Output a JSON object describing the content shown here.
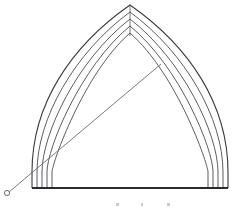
{
  "figure": {
    "type": "technical-line-drawing",
    "background_color": "#ffffff",
    "line_color": "#4a4a50",
    "baseline_color": "#2b2b2f",
    "canvas": {
      "width": 244,
      "height": 210
    }
  },
  "geometry": {
    "apex": {
      "x": 130,
      "y": 5
    },
    "springing_left": {
      "x": 32,
      "y": 188
    },
    "springing_right": {
      "x": 228,
      "y": 188
    },
    "baseline": {
      "x1": 32,
      "y1": 188,
      "x2": 228,
      "y2": 188
    },
    "centerline": {
      "x1": 130,
      "y1": 5,
      "x2": 130,
      "y2": 36
    },
    "moulding_count": 5,
    "moulding_offsets_px": [
      0,
      5,
      10,
      15,
      20
    ]
  },
  "construction": {
    "center_marker": {
      "x": 7,
      "y": 193,
      "radius": 2.6,
      "label": "compass centre point"
    },
    "radius_line": {
      "x1": 9,
      "y1": 192,
      "x2": 161,
      "y2": 64,
      "label": "construction radius"
    }
  },
  "annotations": {
    "caption_marks": [
      {
        "x": 116,
        "y": 205
      },
      {
        "x": 141,
        "y": 205
      },
      {
        "x": 167,
        "y": 205
      }
    ],
    "caption_text": ""
  },
  "icons": {
    "center_point": "circle-outline-icon",
    "radius": "diagonal-line-icon"
  }
}
